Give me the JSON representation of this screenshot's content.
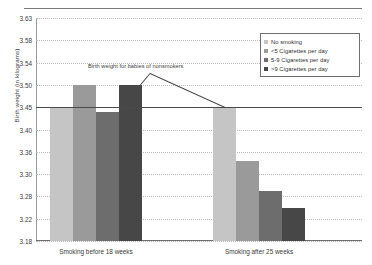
{
  "chart_data": {
    "type": "bar",
    "title": "",
    "subtitle": "",
    "xlabel": "",
    "ylabel": "Birth weight (in kilograms)",
    "grid": true,
    "legend_position": "top-right",
    "ylim": [
      3.18,
      3.63
    ],
    "ytick_labels": [
      "3.63",
      "3.58",
      "3.54",
      "3.50",
      "3.45",
      "3.40",
      "3.36",
      "3.30",
      "3.28",
      "3.22",
      "3.18"
    ],
    "ytick_values": [
      3.63,
      3.58,
      3.54,
      3.5,
      3.45,
      3.4,
      3.36,
      3.3,
      3.28,
      3.22,
      3.18
    ],
    "categories": [
      "Smoking before 18 weeks",
      "Smoking after 25 weeks"
    ],
    "series": [
      {
        "name": "No smoking",
        "color": "#c5c5c5",
        "values": [
          3.45,
          3.45
        ]
      },
      {
        "name": "<5 Cigarettes per day",
        "color": "#9a9a9a",
        "values": [
          3.5,
          3.335
        ]
      },
      {
        "name": "5-9 Cigarettes per day",
        "color": "#6d6d6d",
        "values": [
          3.44,
          3.285
        ]
      },
      {
        "name": ">9 Cigarettes per day",
        "color": "#474747",
        "values": [
          3.5,
          3.25
        ]
      }
    ],
    "reference_line": {
      "label": "Birth weight for babies of nonsmokers",
      "value": 3.45
    }
  },
  "legend": {
    "entries": [
      {
        "label": "No smoking"
      },
      {
        "label": "<5 Cigarettes per day"
      },
      {
        "label": "5-9 Cigarettes per day"
      },
      {
        "label": ">9 Cigarettes per day"
      }
    ]
  },
  "colors": {
    "series_1": "#c5c5c5",
    "series_2": "#9a9a9a",
    "series_3": "#6d6d6d",
    "series_4": "#474747",
    "axis": "#6e6e6e",
    "grid": "#b9b9b9",
    "text": "#3c3c3c"
  }
}
